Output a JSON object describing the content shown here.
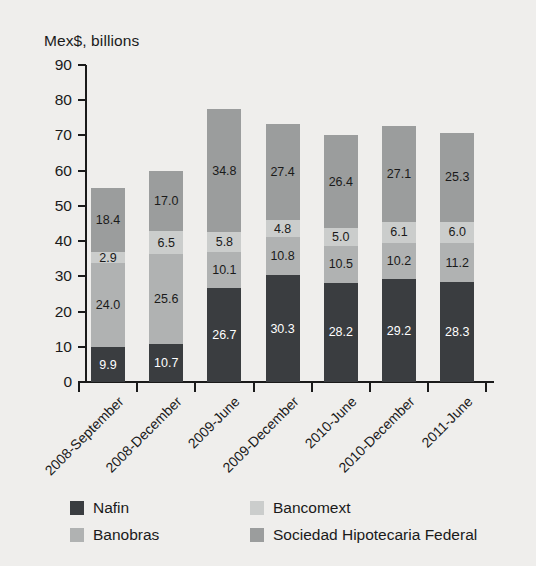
{
  "chart_data": {
    "type": "bar",
    "subtype": "stacked-vertical",
    "title": "Mex$, billions",
    "xlabel": "",
    "ylabel": "Mex$, billions",
    "ylim": [
      0,
      90
    ],
    "y_ticks": [
      0,
      10,
      20,
      30,
      40,
      50,
      60,
      70,
      80,
      90
    ],
    "grid": false,
    "legend_position": "bottom",
    "categories": [
      "2008-September",
      "2008-December",
      "2009-June",
      "2009-December",
      "2010-June",
      "2010-December",
      "2011-June"
    ],
    "series": [
      {
        "name": "Nafin",
        "color": "#3a3d40",
        "label_color": "#ffffff",
        "values": [
          9.9,
          10.7,
          26.7,
          30.3,
          28.2,
          29.2,
          28.3
        ],
        "labels": [
          "9.9",
          "10.7",
          "26.7",
          "30.3",
          "28.2",
          "29.2",
          "28.3"
        ]
      },
      {
        "name": "Banobras",
        "color": "#b0b2b2",
        "label_color": "#1a1a1a",
        "values": [
          24.0,
          25.6,
          10.1,
          10.8,
          10.5,
          10.2,
          11.2
        ],
        "labels": [
          "24.0",
          "25.6",
          "10.1",
          "10.8",
          "10.5",
          "10.2",
          "11.2"
        ]
      },
      {
        "name": "Bancomext",
        "color": "#cbcdcc",
        "label_color": "#1a1a1a",
        "values": [
          2.9,
          6.5,
          5.8,
          4.8,
          5.0,
          6.1,
          6.0
        ],
        "labels": [
          "2.9",
          "6.5",
          "5.8",
          "4.8",
          "5.0",
          "6.1",
          "6.0"
        ]
      },
      {
        "name": "Sociedad Hipotecaria Federal",
        "color": "#9b9d9d",
        "label_color": "#1a1a1a",
        "values": [
          18.4,
          17.0,
          34.8,
          27.4,
          26.4,
          27.1,
          25.3
        ],
        "labels": [
          "18.4",
          "17.0",
          "34.8",
          "27.4",
          "26.4",
          "27.1",
          "25.3"
        ]
      }
    ],
    "totals": [
      55.2,
      59.8,
      77.4,
      73.3,
      70.1,
      72.6,
      70.8
    ]
  },
  "legend": {
    "entries": [
      {
        "label": "Nafin",
        "color": "#3a3d40"
      },
      {
        "label": "Bancomext",
        "color": "#cbcdcc"
      },
      {
        "label": "Banobras",
        "color": "#b0b2b2"
      },
      {
        "label": "Sociedad Hipotecaria Federal",
        "color": "#9b9d9d"
      }
    ]
  },
  "colors": {
    "background": "#efeeec",
    "axis": "#1a1a1a",
    "text": "#1a1a1a"
  }
}
